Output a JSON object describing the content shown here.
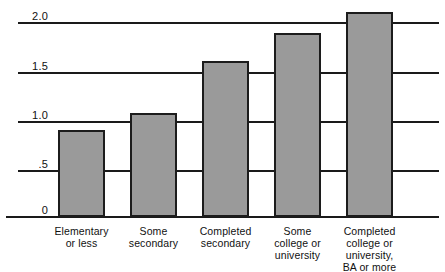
{
  "chart_data": {
    "type": "bar",
    "title": "",
    "subtitle": "",
    "xlabel": "",
    "ylabel": "",
    "categories": [
      "Elementary or less",
      "Some secondary",
      "Completed secondary",
      "Some college or university",
      "Completed college or university, BA or more"
    ],
    "category_lines": [
      [
        "Elementary",
        "or less"
      ],
      [
        "Some",
        "secondary"
      ],
      [
        "Completed",
        "secondary"
      ],
      [
        "Some",
        "college or",
        "university"
      ],
      [
        "Completed",
        "college or",
        "university,",
        "BA or more"
      ]
    ],
    "values": [
      0.9,
      1.07,
      1.61,
      1.9,
      2.11
    ],
    "ylim": [
      0,
      2.2
    ],
    "ytick_values": [
      0,
      0.5,
      1.0,
      1.5,
      2.0
    ],
    "ytick_labels": [
      "0",
      ".5",
      "1.0",
      "1.5",
      "2.0"
    ],
    "grid": true,
    "legend": null,
    "legend_position": "none",
    "bar_fill_color": "#9a9a9a",
    "bar_border_color": "#1c1c1c",
    "axis_color": "#1a1a1a",
    "background_color": "#ffffff"
  }
}
